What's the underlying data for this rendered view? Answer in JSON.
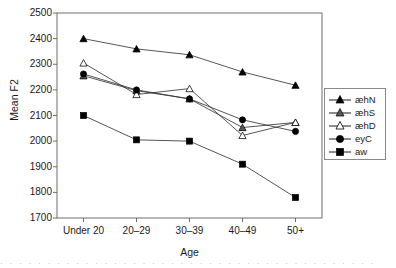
{
  "chart_data": {
    "type": "line",
    "title": "",
    "xlabel": "Age",
    "ylabel": "Mean F2",
    "categories": [
      "Under 20",
      "20–29",
      "30–39",
      "40–49",
      "50+"
    ],
    "ylim": [
      1700,
      2500
    ],
    "yticks": [
      1700,
      1800,
      1900,
      2000,
      2100,
      2200,
      2300,
      2400,
      2500
    ],
    "grid": false,
    "legend_position": "right",
    "series": [
      {
        "name": "æhN",
        "marker": "filled-triangle",
        "color": "#000000",
        "values": [
          2400,
          2360,
          2337,
          2270,
          2218
        ]
      },
      {
        "name": "æhS",
        "marker": "gray-triangle",
        "color": "#595959",
        "values": [
          2255,
          2197,
          2165,
          2053,
          2073
        ]
      },
      {
        "name": "æhD",
        "marker": "open-triangle",
        "color": "#ffffff",
        "values": [
          2305,
          2182,
          2205,
          2022,
          2073
        ]
      },
      {
        "name": "eyC",
        "marker": "filled-circle",
        "color": "#000000",
        "values": [
          2262,
          2200,
          2165,
          2083,
          2038
        ]
      },
      {
        "name": "aw",
        "marker": "filled-square",
        "color": "#000000",
        "values": [
          2100,
          2005,
          2000,
          1910,
          1780
        ]
      }
    ]
  },
  "legend": {
    "items": [
      {
        "label": "æhN"
      },
      {
        "label": "æhS"
      },
      {
        "label": "æhD"
      },
      {
        "label": "eyC"
      },
      {
        "label": "aw"
      }
    ]
  },
  "axes": {
    "y_tick_labels": [
      "2500",
      "2400",
      "2300",
      "2200",
      "2100",
      "2000",
      "1900",
      "1800",
      "1700"
    ],
    "x_tick_labels": [
      "Under 20",
      "20–29",
      "30–39",
      "40–49",
      "50+"
    ],
    "y_axis_title": "Mean F2",
    "x_axis_title": "Age"
  },
  "caption_fragment": "· · · ·   · · · · ·   · · ·   · · · ·   · · · · ·   · · ·   · · · ·   · · · · ·   · · ·   · · · ·"
}
